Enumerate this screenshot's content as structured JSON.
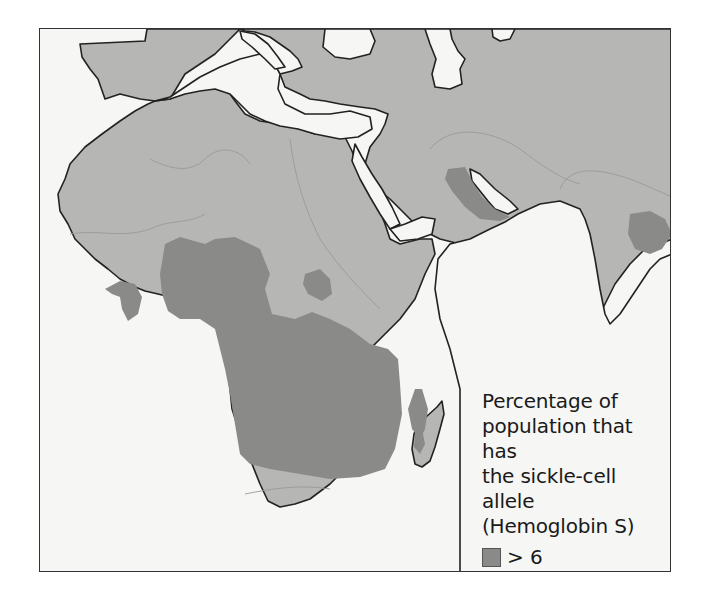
{
  "map": {
    "title": "Distribution of the sickle-cell allele in Africa, the Middle East and South Asia",
    "colors": {
      "background": "#f6f6f4",
      "water": "#f6f6f4",
      "land_2_6": "#b6b6b4",
      "high_gt6": "#8a8a88",
      "outline": "#222222",
      "border": "#333333"
    }
  },
  "legend": {
    "title_lines": [
      "Percentage of",
      "population that has",
      "the sickle-cell allele",
      "(Hemoglobin S)"
    ],
    "items": [
      {
        "label": "> 6",
        "color": "#8a8a88"
      },
      {
        "label": "2–6",
        "color": "#b6b6b4"
      }
    ]
  }
}
